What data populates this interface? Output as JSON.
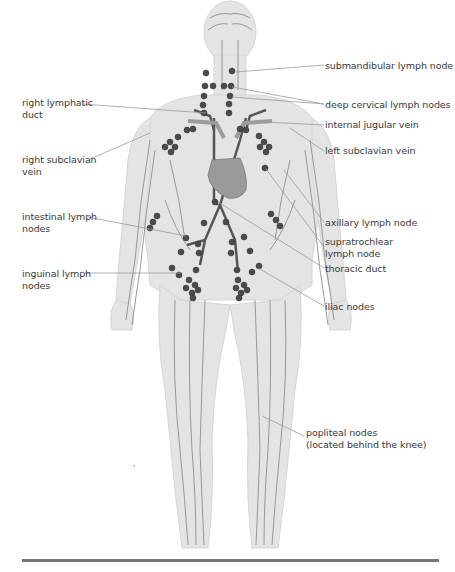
{
  "diagram": {
    "colors": {
      "body_fill": "#e4e4e4",
      "body_outline": "#d2d2d2",
      "vessel": "#8a8a8a",
      "duct": "#555555",
      "node": "#4a4a4a",
      "heart": "#9a9a9a",
      "leader_line": "#9a9a9a",
      "text": "#3a3a3a",
      "rule": "#777777"
    },
    "labels_left": [
      {
        "id": "right-lymphatic-duct",
        "text": "right lymphatic\nduct"
      },
      {
        "id": "right-subclavian-vein",
        "text": "right subclavian\nvein"
      },
      {
        "id": "intestinal-lymph-nodes",
        "text": "intestinal lymph\nnodes"
      },
      {
        "id": "inguinal-lymph-nodes",
        "text": "inguinal lymph\nnodes"
      }
    ],
    "labels_right": [
      {
        "id": "submandibular-lymph-node",
        "text": "submandibular lymph node"
      },
      {
        "id": "deep-cervical-lymph-nodes",
        "text": "deep cervical lymph nodes"
      },
      {
        "id": "internal-jugular-vein",
        "text": "internal jugular vein"
      },
      {
        "id": "left-subclavian-vein",
        "text": "left subclavian vein"
      },
      {
        "id": "axillary-lymph-node",
        "text": "axillary lymph node"
      },
      {
        "id": "supratrochlear-lymph-node",
        "text": "supratrochlear\nlymph node"
      },
      {
        "id": "thoracic-duct",
        "text": "thoracic duct"
      },
      {
        "id": "iliac-nodes",
        "text": "iliac nodes"
      },
      {
        "id": "popliteal-nodes",
        "text": "popliteal nodes\n(located behind the knee)"
      }
    ]
  }
}
